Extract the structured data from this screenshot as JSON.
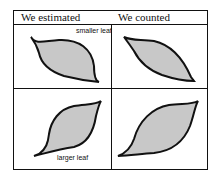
{
  "headers": {
    "left": "We estimated",
    "right": "We counted"
  },
  "labels": {
    "smaller": "smaller leaf",
    "larger": "larger leaf"
  },
  "colors": {
    "leaf_fill": "#c8c8c8",
    "stroke": "#111111"
  }
}
